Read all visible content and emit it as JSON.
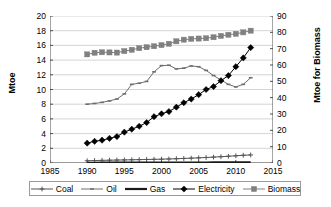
{
  "chart_data": {
    "type": "line",
    "title": "",
    "xlabel": "",
    "ylabel": "Mtoe",
    "y2label": "Mtoe for Biomass",
    "grid": true,
    "legend_position": "bottom",
    "xlim": [
      1985,
      2015
    ],
    "ylim": [
      0,
      20
    ],
    "y2lim": [
      0,
      90
    ],
    "x_ticks": [
      1985,
      1990,
      1995,
      2000,
      2005,
      2010,
      2015
    ],
    "y_ticks": [
      0,
      2,
      4,
      6,
      8,
      10,
      12,
      14,
      16,
      18,
      20
    ],
    "y2_ticks": [
      0,
      10,
      20,
      30,
      40,
      50,
      60,
      70,
      80,
      90
    ],
    "x": [
      1990,
      1991,
      1992,
      1993,
      1994,
      1995,
      1996,
      1997,
      1998,
      1999,
      2000,
      2001,
      2002,
      2003,
      2004,
      2005,
      2006,
      2007,
      2008,
      2009,
      2010,
      2011,
      2012
    ],
    "series": [
      {
        "name": "Coal",
        "axis": "left",
        "marker": "plus",
        "color": "#555555",
        "values": [
          0.3,
          0.33,
          0.36,
          0.38,
          0.4,
          0.42,
          0.44,
          0.46,
          0.48,
          0.5,
          0.52,
          0.55,
          0.58,
          0.62,
          0.66,
          0.7,
          0.75,
          0.8,
          0.86,
          0.92,
          0.98,
          1.05,
          1.1
        ]
      },
      {
        "name": "Oil",
        "axis": "left",
        "marker": "dash",
        "color": "#6e6e6e",
        "values": [
          8.0,
          8.1,
          8.25,
          8.45,
          8.7,
          9.4,
          10.7,
          10.85,
          11.1,
          12.4,
          13.25,
          13.3,
          12.8,
          12.9,
          13.2,
          13.1,
          12.6,
          11.9,
          11.3,
          10.7,
          10.35,
          10.7,
          11.6
        ]
      },
      {
        "name": "Gas",
        "axis": "left",
        "marker": "none",
        "color": "#1a1a1a",
        "values": [
          0.03,
          0.03,
          0.04,
          0.04,
          0.04,
          0.05,
          0.05,
          0.05,
          0.05,
          0.06,
          0.06,
          0.06,
          0.06,
          0.07,
          0.07,
          0.07,
          0.07,
          0.08,
          0.08,
          0.08,
          0.08,
          0.09,
          0.09
        ]
      },
      {
        "name": "Electricity",
        "axis": "left",
        "marker": "diamond",
        "color": "#000000",
        "values": [
          2.7,
          2.95,
          3.1,
          3.35,
          3.6,
          4.2,
          4.6,
          5.0,
          5.5,
          6.3,
          6.7,
          7.0,
          7.6,
          8.2,
          8.7,
          9.3,
          10.0,
          10.4,
          11.2,
          11.9,
          13.1,
          14.3,
          15.7
        ]
      },
      {
        "name": "Biomass",
        "axis": "right",
        "marker": "square",
        "color": "#808080",
        "values": [
          66.5,
          67.5,
          67.8,
          67.7,
          67.6,
          68.5,
          69.3,
          70.3,
          70.9,
          71.5,
          72.2,
          73.0,
          74.5,
          75.5,
          76.0,
          76.2,
          76.4,
          77.0,
          77.8,
          78.5,
          79.1,
          80.0,
          81.0
        ]
      }
    ]
  },
  "axes": {
    "y_left_title": "Mtoe",
    "y_right_title": "Mtoe for Biomass"
  },
  "legend": {
    "items": [
      {
        "label": "Coal",
        "marker": "plus-marker",
        "color": "#555555"
      },
      {
        "label": "Oil",
        "marker": "dash-marker",
        "color": "#6e6e6e"
      },
      {
        "label": "Gas",
        "marker": "line-marker",
        "color": "#1a1a1a"
      },
      {
        "label": "Electricity",
        "marker": "diamond-marker",
        "color": "#000000"
      },
      {
        "label": "Biomass",
        "marker": "square-marker",
        "color": "#808080"
      }
    ]
  }
}
